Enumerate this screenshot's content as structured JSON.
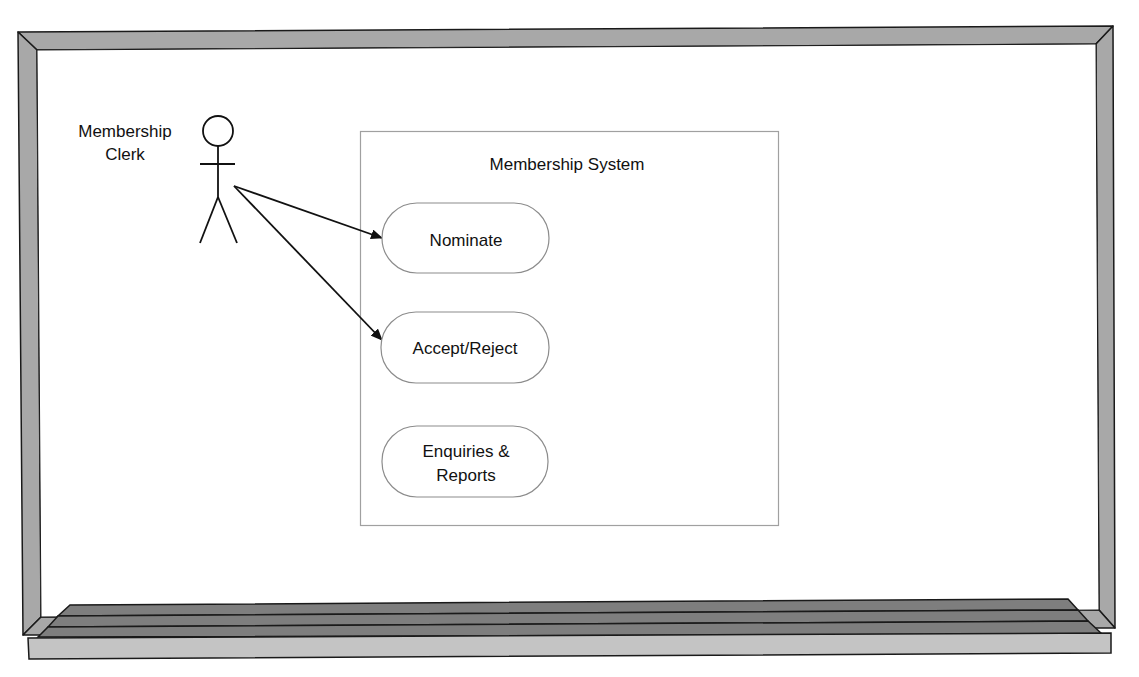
{
  "diagram": {
    "type": "uml-use-case",
    "setting": "whiteboard",
    "actor": {
      "name_lines": [
        "Membership",
        "Clerk"
      ]
    },
    "system": {
      "title": "Membership System"
    },
    "use_cases": [
      {
        "id": "nominate",
        "lines": [
          "Nominate"
        ]
      },
      {
        "id": "accept-reject",
        "lines": [
          "Accept/Reject"
        ]
      },
      {
        "id": "enquiries-reports",
        "lines": [
          "Enquiries &",
          "Reports"
        ]
      }
    ],
    "associations": [
      {
        "from": "actor",
        "to": "nominate",
        "arrow": "to"
      },
      {
        "from": "actor",
        "to": "accept-reject",
        "arrow": "to"
      }
    ]
  },
  "colors": {
    "frame_fill": "#a8a8a8",
    "frame_stroke": "#1a1a1a",
    "ledge_dark": "#7e7e7e",
    "ledge_light": "#c4c4c4",
    "system_border": "#a0a0a0",
    "use_case_border": "#8c8c8c",
    "line": "#111111"
  }
}
